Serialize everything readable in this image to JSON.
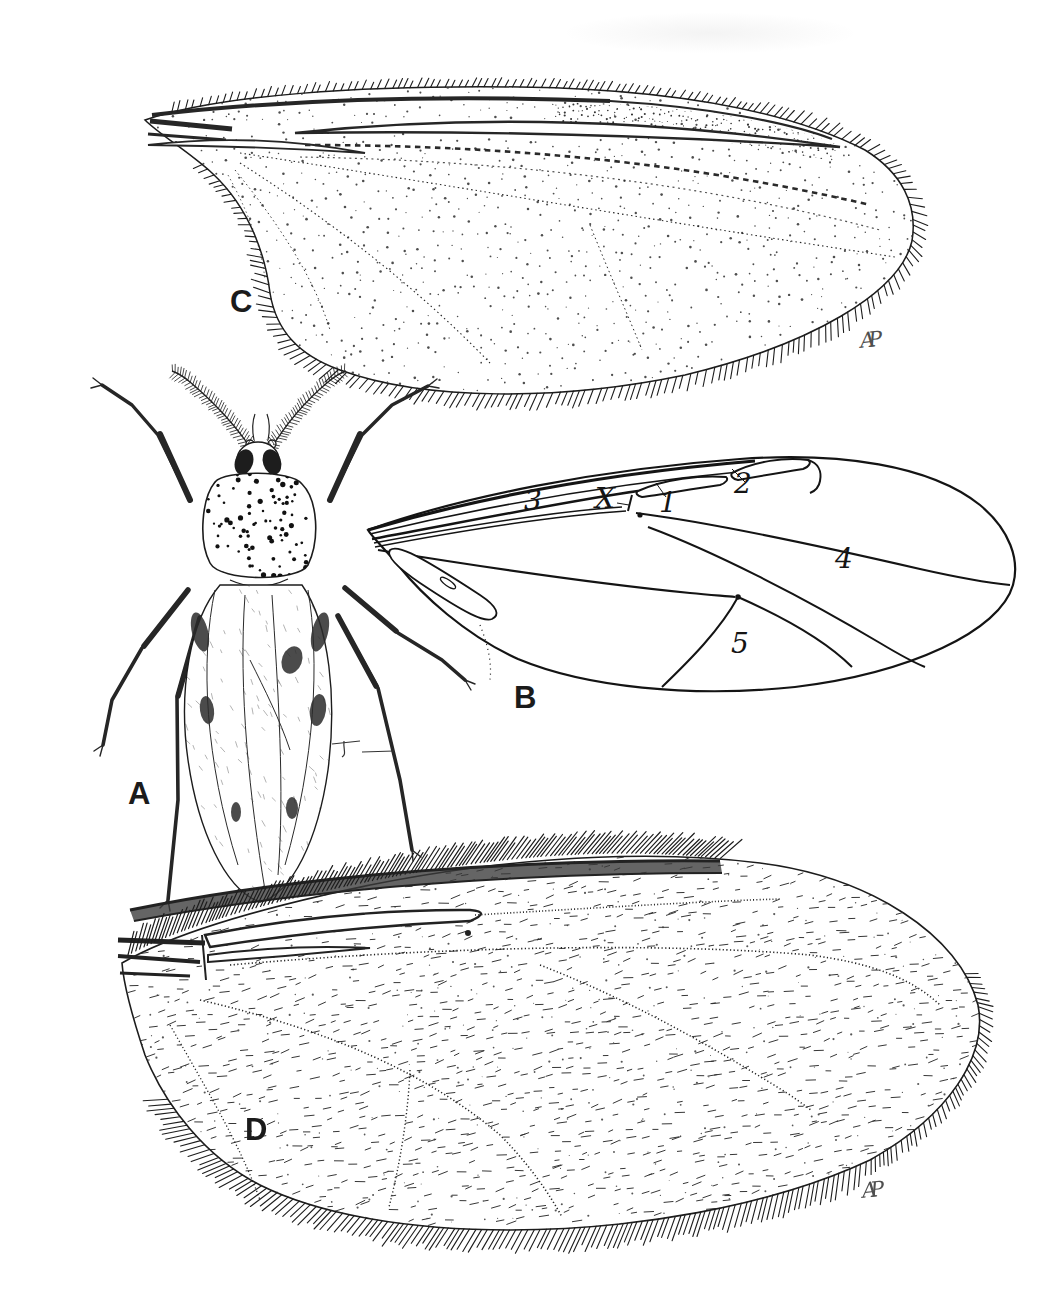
{
  "panel_labels": {
    "a": "A",
    "b": "B",
    "c": "C",
    "d": "D"
  },
  "wing_b_cell_labels": {
    "c1": "1",
    "c2": "2",
    "c3": "3",
    "c4": "4",
    "c5": "5",
    "crossvein": "X"
  },
  "artist_monograms": {
    "panel_c": "AP",
    "panel_d": "AP"
  },
  "colors": {
    "ink": "#1c1c1c",
    "paper": "#ffffff"
  }
}
